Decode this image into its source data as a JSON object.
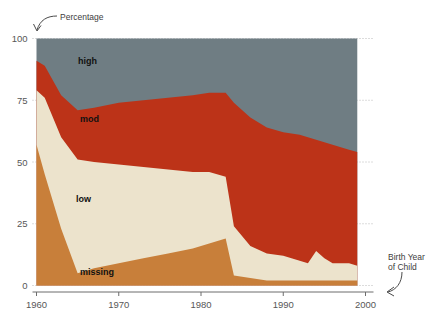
{
  "title": {
    "clipped_text": ""
  },
  "annotations": {
    "y_axis": "Percentage",
    "x_axis": "Birth Year\nof Child"
  },
  "colors": {
    "high": "#6f7d83",
    "mod": "#bc3318",
    "low": "#ece3cc",
    "missing": "#c87f3a",
    "gridline": "#b9b9b9",
    "axis": "#6d6d6d",
    "text": "#575757",
    "background": "#ffffff"
  },
  "band_labels": {
    "high": "high",
    "mod": "mod",
    "low": "low",
    "missing": "missing"
  },
  "chart_data": {
    "type": "area",
    "title": "",
    "xlabel": "Birth Year of Child",
    "ylabel": "Percentage",
    "xlim": [
      1960,
      2000
    ],
    "ylim": [
      0,
      100
    ],
    "xticks": [
      1960,
      1970,
      1980,
      1990,
      2000
    ],
    "yticks": [
      0,
      25,
      50,
      75,
      100
    ],
    "xtick_labels": [
      "1960",
      "1970",
      "1980",
      "1990",
      "2000"
    ],
    "ytick_labels": [
      "0",
      "25",
      "50",
      "75",
      "100"
    ],
    "grid": true,
    "legend": "inline-band-labels",
    "stacked": true,
    "stack_order_bottom_to_top": [
      "missing",
      "low",
      "mod",
      "high"
    ],
    "x": [
      1960,
      1961,
      1963,
      1965,
      1967,
      1970,
      1973,
      1976,
      1979,
      1981,
      1983,
      1984,
      1986,
      1988,
      1990,
      1992,
      1993,
      1994,
      1995,
      1996,
      1997,
      1998,
      1999
    ],
    "series": [
      {
        "name": "missing",
        "color": "#c87f3a",
        "values": [
          57,
          45,
          23,
          5,
          7,
          9,
          11,
          13,
          15,
          17,
          19,
          4,
          3,
          2,
          2,
          2,
          2,
          2,
          2,
          2,
          2,
          2,
          2
        ]
      },
      {
        "name": "low",
        "color": "#ece3cc",
        "values": [
          22,
          31,
          37,
          46,
          43,
          40,
          37,
          34,
          31,
          29,
          25,
          20,
          13,
          11,
          10,
          8,
          7,
          12,
          9,
          7,
          7,
          7,
          6
        ]
      },
      {
        "name": "mod",
        "color": "#bc3318",
        "values": [
          12,
          13,
          17,
          20,
          22,
          25,
          27,
          29,
          31,
          32,
          34,
          50,
          52,
          51,
          50,
          51,
          51,
          45,
          47,
          48,
          47,
          46,
          46
        ]
      },
      {
        "name": "high",
        "color": "#6f7d83",
        "values": [
          9,
          11,
          23,
          29,
          28,
          26,
          25,
          24,
          23,
          22,
          22,
          26,
          32,
          36,
          38,
          39,
          40,
          41,
          42,
          43,
          44,
          45,
          46
        ]
      }
    ],
    "cumulative_top_boundaries": {
      "note": "upper edge of each stacked band, percent of total",
      "missing_top": [
        57,
        45,
        23,
        5,
        7,
        9,
        11,
        13,
        15,
        17,
        19,
        4,
        3,
        2,
        2,
        2,
        2,
        2,
        2,
        2,
        2,
        2,
        2
      ],
      "low_top": [
        79,
        76,
        60,
        51,
        50,
        49,
        48,
        47,
        46,
        46,
        44,
        24,
        16,
        13,
        12,
        10,
        9,
        14,
        11,
        9,
        9,
        9,
        8
      ],
      "mod_top": [
        91,
        89,
        77,
        71,
        72,
        74,
        75,
        76,
        77,
        78,
        78,
        74,
        68,
        64,
        62,
        61,
        60,
        59,
        58,
        57,
        56,
        55,
        54
      ],
      "high_top": [
        100,
        100,
        100,
        100,
        100,
        100,
        100,
        100,
        100,
        100,
        100,
        100,
        100,
        100,
        100,
        100,
        100,
        100,
        100,
        100,
        100,
        100,
        100
      ]
    }
  }
}
